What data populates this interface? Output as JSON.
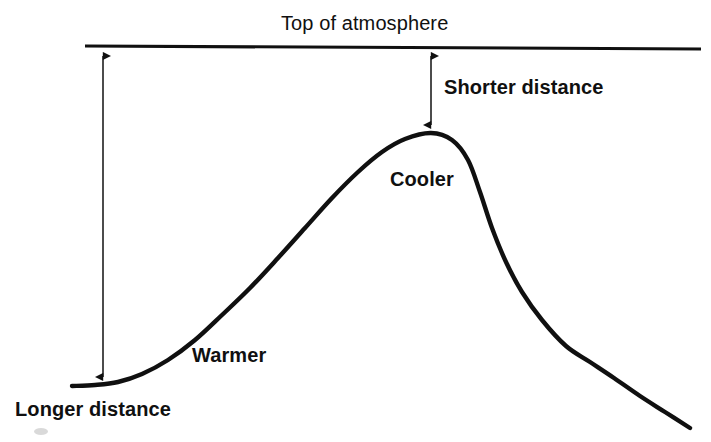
{
  "figure": {
    "kind": "science-diagram",
    "background_color": "#ffffff",
    "ink_color": "#101010"
  },
  "labels": {
    "top_of_atmosphere": "Top of atmosphere",
    "shorter_distance": "Shorter distance",
    "cooler": "Cooler",
    "warmer": "Warmer",
    "longer_distance": "Longer distance"
  },
  "chart_data": {
    "type": "line",
    "title": "Top of atmosphere",
    "xlabel": "",
    "ylabel": "",
    "grid": false,
    "legend": "none",
    "annotations": [
      {
        "name": "top-of-atmosphere",
        "text": "Top of atmosphere",
        "x": 381,
        "y": 22,
        "role": "title-above-boundary-line"
      },
      {
        "name": "shorter-distance",
        "text": "Shorter distance",
        "x": 444,
        "y": 88,
        "role": "arrow-label-right"
      },
      {
        "name": "cooler",
        "text": "Cooler",
        "x": 390,
        "y": 180,
        "role": "curve-label-peak"
      },
      {
        "name": "warmer",
        "text": "Warmer",
        "x": 192,
        "y": 356,
        "role": "curve-label-low"
      },
      {
        "name": "longer-distance",
        "text": "Longer distance",
        "x": 15,
        "y": 410,
        "role": "arrow-label-below"
      }
    ],
    "boundary_line": {
      "name": "top-of-atmosphere-line",
      "x1": 85,
      "y1": 46,
      "x2": 701,
      "y2": 49
    },
    "arrows": [
      {
        "name": "longer-distance-arrow",
        "double_headed": true,
        "x": 103,
        "y_top": 48,
        "y_bottom": 385,
        "length_px": 337,
        "meaning": "Longer distance"
      },
      {
        "name": "shorter-distance-arrow",
        "double_headed": true,
        "x": 431,
        "y_top": 48,
        "y_bottom": 133,
        "length_px": 85,
        "meaning": "Shorter distance"
      }
    ],
    "curve_points": [
      [
        72,
        386
      ],
      [
        95,
        385
      ],
      [
        118,
        382
      ],
      [
        142,
        374
      ],
      [
        168,
        360
      ],
      [
        195,
        340
      ],
      [
        222,
        315
      ],
      [
        250,
        288
      ],
      [
        278,
        258
      ],
      [
        305,
        228
      ],
      [
        332,
        198
      ],
      [
        358,
        172
      ],
      [
        382,
        152
      ],
      [
        405,
        139
      ],
      [
        431,
        133
      ],
      [
        452,
        140
      ],
      [
        468,
        160
      ],
      [
        480,
        192
      ],
      [
        492,
        228
      ],
      [
        506,
        262
      ],
      [
        522,
        292
      ],
      [
        542,
        320
      ],
      [
        566,
        346
      ],
      [
        590,
        362
      ],
      [
        614,
        378
      ],
      [
        640,
        396
      ],
      [
        665,
        412
      ],
      [
        690,
        428
      ]
    ]
  }
}
